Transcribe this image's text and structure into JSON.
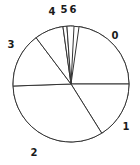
{
  "chart_data": {
    "type": "pie",
    "title": "",
    "subtitle": "",
    "xlabel": "",
    "ylabel": "",
    "grid": false,
    "legend_position": "none",
    "labels_position": "outside",
    "start_angle_deg": 0,
    "direction": "counterclockwise",
    "categories": [
      "0",
      "1",
      "2",
      "3",
      "4",
      "5",
      "6"
    ],
    "values": [
      22.8,
      16.1,
      33.3,
      15.3,
      8.1,
      1.1,
      1.9
    ],
    "angles_deg": [
      82,
      58,
      120,
      55,
      29,
      4,
      7
    ],
    "slices": [
      {
        "label": "0",
        "angle_deg": 82,
        "percent": 22.8,
        "start_deg": 0,
        "end_deg": 82,
        "label_x": 115,
        "label_y": 36
      },
      {
        "label": "1",
        "angle_deg": 58,
        "percent": 16.1,
        "start_deg": 302,
        "end_deg": 360,
        "label_x": 126,
        "label_y": 127
      },
      {
        "label": "2",
        "angle_deg": 120,
        "percent": 33.3,
        "start_deg": 182,
        "end_deg": 302,
        "label_x": 34,
        "label_y": 153
      },
      {
        "label": "3",
        "angle_deg": 55,
        "percent": 15.3,
        "start_deg": 127,
        "end_deg": 182,
        "label_x": 11,
        "label_y": 45
      },
      {
        "label": "4",
        "angle_deg": 29,
        "percent": 8.1,
        "start_deg": 98,
        "end_deg": 127,
        "label_x": 52,
        "label_y": 12
      },
      {
        "label": "5",
        "angle_deg": 4,
        "percent": 1.1,
        "start_deg": 94,
        "end_deg": 98,
        "label_x": 64,
        "label_y": 10
      },
      {
        "label": "6",
        "angle_deg": 7,
        "percent": 1.9,
        "start_deg": 87,
        "end_deg": 94,
        "label_x": 73,
        "label_y": 10
      }
    ],
    "geometry": {
      "center_x": 71,
      "center_y": 84,
      "radius": 58
    },
    "style": {
      "stroke_color": "#333333",
      "fill_color": "#ffffff",
      "label_color": "#1a1a1a",
      "background": "#ffffff"
    }
  }
}
